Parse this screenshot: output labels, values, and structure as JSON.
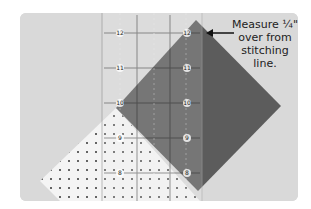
{
  "photo": {
    "description": "Quilting ruler over a dark square and a white dotted fabric square",
    "background_color": "#d8d8d8",
    "dark_fabric_color": "#5a5a5a",
    "light_fabric_color": "#f4f4f4",
    "ruler_markings": [
      "12",
      "12",
      "11",
      "11",
      "10",
      "10",
      "10",
      "9",
      "9",
      "8",
      "8"
    ]
  },
  "annotation": {
    "line1": "Measure ¼\"",
    "line2": "over from",
    "line3": "stitching",
    "line4": "line.",
    "arrow": "left-arrow"
  }
}
